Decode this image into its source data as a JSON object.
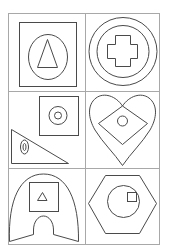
{
  "figure": {
    "type": "shape-matrix",
    "rows": 3,
    "columns": 2,
    "colors": {
      "background": "#ffffff",
      "grid": "#a8a8a8",
      "shape_stroke": "#4a4a4a"
    },
    "cells": [
      {
        "row": 1,
        "col": 1,
        "description": "square containing ellipse containing tall triangle"
      },
      {
        "row": 1,
        "col": 2,
        "description": "two concentric circles containing a cross"
      },
      {
        "row": 2,
        "col": 1,
        "description": "square with concentric circles, and right triangle with concentric ellipses"
      },
      {
        "row": 2,
        "col": 2,
        "description": "heart containing diamond containing small circle"
      },
      {
        "row": 3,
        "col": 1,
        "description": "arch shape containing square containing small triangle"
      },
      {
        "row": 3,
        "col": 2,
        "description": "hexagon containing circle containing small square"
      }
    ]
  }
}
